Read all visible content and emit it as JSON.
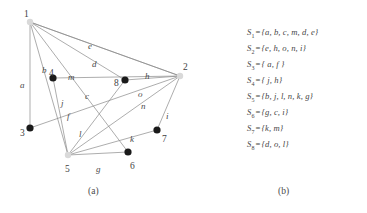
{
  "figure": {
    "panel_a_caption": "(a)",
    "panel_b_caption": "(b)"
  },
  "graph": {
    "nodes": [
      {
        "id": "1",
        "label": "1",
        "x": 30,
        "y": 22,
        "fill": "#d9d9d9",
        "r": 3.2,
        "label_dx": -6,
        "label_dy": -12
      },
      {
        "id": "2",
        "label": "2",
        "x": 180,
        "y": 76,
        "fill": "#d9d9d9",
        "r": 3.2,
        "label_dx": 3,
        "label_dy": -13
      },
      {
        "id": "3",
        "label": "3",
        "x": 30,
        "y": 128,
        "fill": "#1a1a1a",
        "r": 3.6,
        "label_dx": -10,
        "label_dy": 1
      },
      {
        "id": "4",
        "label": "4",
        "x": 53,
        "y": 78,
        "fill": "#1a1a1a",
        "r": 3.6,
        "label_dx": -4,
        "label_dy": -9
      },
      {
        "id": "5",
        "label": "5",
        "x": 68,
        "y": 155,
        "fill": "#d9d9d9",
        "r": 3.2,
        "label_dx": -3,
        "label_dy": 10
      },
      {
        "id": "6",
        "label": "6",
        "x": 128,
        "y": 152,
        "fill": "#1a1a1a",
        "r": 3.6,
        "label_dx": 2,
        "label_dy": 10
      },
      {
        "id": "7",
        "label": "7",
        "x": 157,
        "y": 130,
        "fill": "#1a1a1a",
        "r": 3.6,
        "label_dx": 5,
        "label_dy": 5
      },
      {
        "id": "8",
        "label": "8",
        "x": 125,
        "y": 80,
        "fill": "#1a1a1a",
        "r": 3.6,
        "label_dx": -11,
        "label_dy": -1
      }
    ],
    "edges": [
      {
        "name": "a",
        "from": "1",
        "to": "3",
        "label": "a",
        "lx": 20,
        "ly": 81
      },
      {
        "name": "b",
        "from": "1",
        "to": "5",
        "label": "b",
        "lx": 42,
        "ly": 66
      },
      {
        "name": "c",
        "from": "1",
        "to": "6",
        "label": "c",
        "lx": 85,
        "ly": 92
      },
      {
        "name": "m",
        "from": "1",
        "to": "8",
        "label": "m",
        "lx": 68,
        "ly": 73
      },
      {
        "name": "d",
        "from": "1",
        "to": "2",
        "label": "d",
        "lx": 92,
        "ly": 60
      },
      {
        "name": "e",
        "from": "1",
        "to": "2",
        "label": "e",
        "lx": 88,
        "ly": 42
      },
      {
        "name": "h",
        "from": "2",
        "to": "4",
        "label": "h",
        "lx": 145,
        "ly": 72
      },
      {
        "name": "o",
        "from": "2",
        "to": "8",
        "label": "o",
        "lx": 138,
        "ly": 90
      },
      {
        "name": "n",
        "from": "2",
        "to": "5",
        "label": "n",
        "lx": 141,
        "ly": 102
      },
      {
        "name": "i",
        "from": "2",
        "to": "7",
        "label": "i",
        "lx": 166,
        "ly": 112
      },
      {
        "name": "f",
        "from": "3",
        "to": "2",
        "label": "f",
        "lx": 67,
        "ly": 112
      },
      {
        "name": "j",
        "from": "4",
        "to": "5",
        "label": "j",
        "lx": 61,
        "ly": 99
      },
      {
        "name": "l",
        "from": "5",
        "to": "8",
        "label": "l",
        "lx": 79,
        "ly": 130
      },
      {
        "name": "k",
        "from": "5",
        "to": "7",
        "label": "k",
        "lx": 130,
        "ly": 135
      },
      {
        "name": "g",
        "from": "5",
        "to": "6",
        "label": "g",
        "lx": 96,
        "ly": 165
      }
    ]
  },
  "sets": [
    {
      "name": "S",
      "subscript": "1",
      "eq": "=",
      "members": "{a, b, c, m, d, e}"
    },
    {
      "name": "S",
      "subscript": "2",
      "eq": "=",
      "members": "{e, h, o, n, i}"
    },
    {
      "name": "S",
      "subscript": "3",
      "eq": "=",
      "members": "{ a, f }"
    },
    {
      "name": "S",
      "subscript": "4",
      "eq": "=",
      "members": "{ j, h}"
    },
    {
      "name": "S",
      "subscript": "5",
      "eq": "=",
      "members": "{b, j, l, n, k, g}"
    },
    {
      "name": "S",
      "subscript": "6",
      "eq": "=",
      "members": "{g, c, i}"
    },
    {
      "name": "S",
      "subscript": "7",
      "eq": "=",
      "members": "{k, m}"
    },
    {
      "name": "S",
      "subscript": "8",
      "eq": "=",
      "members": "{d, o, l}"
    }
  ],
  "colors": {
    "edge_stroke": "#8a8a8a",
    "node_dark": "#1a1a1a",
    "node_light": "#d9d9d9",
    "text": "#464646",
    "background": "#ffffff"
  }
}
